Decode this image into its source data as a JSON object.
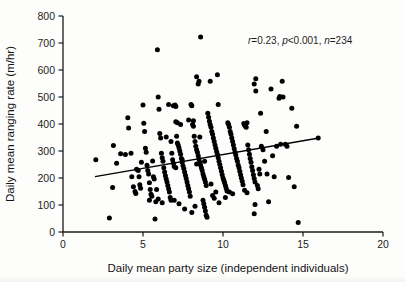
{
  "chart_data": {
    "type": "scatter",
    "title": "",
    "xlabel": "Daily mean party size (independent individuals)",
    "ylabel": "Daily mean ranging rate (m/hr)",
    "xlim": [
      0,
      20
    ],
    "ylim": [
      0,
      800
    ],
    "xticks": [
      0,
      5,
      10,
      15,
      20
    ],
    "yticks": [
      0,
      100,
      200,
      300,
      400,
      500,
      600,
      700,
      800
    ],
    "grid": false,
    "legend": null,
    "marker": {
      "shape": "circle",
      "color": "#000000",
      "size_px": 5
    },
    "annotations": [
      {
        "name": "stats-annotation",
        "text": "r=0.23, p<0.001, n=234",
        "parts": [
          {
            "text": "r",
            "italic": true
          },
          {
            "text": "=0.23, ",
            "italic": false
          },
          {
            "text": "p",
            "italic": true
          },
          {
            "text": "<0.001, ",
            "italic": false
          },
          {
            "text": "n",
            "italic": true
          },
          {
            "text": "=234",
            "italic": false
          }
        ],
        "x": 9.7,
        "y": 722
      }
    ],
    "statistics": {
      "r": 0.23,
      "p": "<0.001",
      "n": 234
    },
    "trendline": {
      "type": "linear",
      "x_start": 2.0,
      "y_start": 205,
      "x_end": 16.0,
      "y_end": 348,
      "color": "#000000",
      "width_px": 1.4
    },
    "points": [
      [
        2.05,
        268
      ],
      [
        2.9,
        52
      ],
      [
        3.15,
        320
      ],
      [
        3.1,
        165
      ],
      [
        3.35,
        255
      ],
      [
        3.6,
        290
      ],
      [
        3.9,
        287
      ],
      [
        4.05,
        423
      ],
      [
        4.1,
        385
      ],
      [
        4.25,
        292
      ],
      [
        4.3,
        205
      ],
      [
        4.4,
        168
      ],
      [
        4.5,
        150
      ],
      [
        4.55,
        143
      ],
      [
        4.6,
        232
      ],
      [
        4.7,
        228
      ],
      [
        4.75,
        205
      ],
      [
        4.8,
        175
      ],
      [
        4.85,
        162
      ],
      [
        4.9,
        258
      ],
      [
        5.0,
        470
      ],
      [
        5.05,
        403
      ],
      [
        5.1,
        372
      ],
      [
        5.15,
        310
      ],
      [
        5.2,
        295
      ],
      [
        5.25,
        247
      ],
      [
        5.3,
        228
      ],
      [
        5.35,
        215
      ],
      [
        5.4,
        182
      ],
      [
        5.45,
        157
      ],
      [
        5.5,
        140
      ],
      [
        5.55,
        132
      ],
      [
        5.6,
        263
      ],
      [
        5.65,
        205
      ],
      [
        5.7,
        196
      ],
      [
        5.75,
        48
      ],
      [
        5.8,
        112
      ],
      [
        5.85,
        157
      ],
      [
        5.9,
        675
      ],
      [
        5.95,
        500
      ],
      [
        6.0,
        455
      ],
      [
        6.05,
        365
      ],
      [
        6.1,
        348
      ],
      [
        6.15,
        292
      ],
      [
        6.2,
        275
      ],
      [
        6.25,
        262
      ],
      [
        6.3,
        238
      ],
      [
        6.35,
        222
      ],
      [
        6.4,
        208
      ],
      [
        6.45,
        196
      ],
      [
        6.5,
        185
      ],
      [
        6.55,
        172
      ],
      [
        6.6,
        160
      ],
      [
        6.65,
        148
      ],
      [
        6.7,
        128
      ],
      [
        6.75,
        118
      ],
      [
        6.8,
        292
      ],
      [
        6.85,
        268
      ],
      [
        6.9,
        255
      ],
      [
        6.95,
        243
      ],
      [
        7.0,
        470
      ],
      [
        7.05,
        465
      ],
      [
        7.1,
        355
      ],
      [
        7.15,
        330
      ],
      [
        7.2,
        322
      ],
      [
        7.25,
        312
      ],
      [
        7.3,
        300
      ],
      [
        7.35,
        288
      ],
      [
        7.4,
        272
      ],
      [
        7.45,
        258
      ],
      [
        7.5,
        245
      ],
      [
        7.55,
        235
      ],
      [
        7.6,
        222
      ],
      [
        7.65,
        210
      ],
      [
        7.7,
        198
      ],
      [
        7.75,
        185
      ],
      [
        7.8,
        172
      ],
      [
        7.85,
        160
      ],
      [
        7.9,
        148
      ],
      [
        7.95,
        132
      ],
      [
        8.0,
        472
      ],
      [
        8.05,
        468
      ],
      [
        8.1,
        398
      ],
      [
        8.15,
        392
      ],
      [
        8.2,
        355
      ],
      [
        8.25,
        335
      ],
      [
        8.3,
        318
      ],
      [
        8.35,
        305
      ],
      [
        8.4,
        295
      ],
      [
        8.45,
        282
      ],
      [
        8.5,
        270
      ],
      [
        8.55,
        258
      ],
      [
        8.6,
        248
      ],
      [
        8.65,
        238
      ],
      [
        8.7,
        228
      ],
      [
        8.75,
        215
      ],
      [
        8.8,
        205
      ],
      [
        8.85,
        195
      ],
      [
        8.9,
        185
      ],
      [
        8.95,
        172
      ],
      [
        8.6,
        722
      ],
      [
        8.35,
        575
      ],
      [
        8.45,
        548
      ],
      [
        8.5,
        558
      ],
      [
        8.75,
        118
      ],
      [
        8.8,
        105
      ],
      [
        8.85,
        92
      ],
      [
        8.9,
        78
      ],
      [
        8.95,
        62
      ],
      [
        9.0,
        55
      ],
      [
        9.05,
        440
      ],
      [
        9.1,
        425
      ],
      [
        9.15,
        410
      ],
      [
        9.2,
        398
      ],
      [
        9.25,
        388
      ],
      [
        9.3,
        372
      ],
      [
        9.35,
        362
      ],
      [
        9.4,
        348
      ],
      [
        9.45,
        335
      ],
      [
        9.5,
        322
      ],
      [
        9.55,
        310
      ],
      [
        9.6,
        298
      ],
      [
        9.65,
        288
      ],
      [
        9.7,
        275
      ],
      [
        9.75,
        262
      ],
      [
        9.8,
        250
      ],
      [
        9.85,
        238
      ],
      [
        9.9,
        225
      ],
      [
        9.95,
        212
      ],
      [
        10.0,
        200
      ],
      [
        9.2,
        558
      ],
      [
        9.65,
        582
      ],
      [
        9.7,
        472
      ],
      [
        9.75,
        108
      ],
      [
        9.55,
        148
      ],
      [
        10.05,
        192
      ],
      [
        10.1,
        182
      ],
      [
        10.15,
        172
      ],
      [
        10.2,
        162
      ],
      [
        10.25,
        152
      ],
      [
        10.3,
        405
      ],
      [
        10.35,
        398
      ],
      [
        10.4,
        388
      ],
      [
        10.45,
        372
      ],
      [
        10.5,
        362
      ],
      [
        10.55,
        348
      ],
      [
        10.6,
        335
      ],
      [
        10.65,
        322
      ],
      [
        10.7,
        308
      ],
      [
        10.75,
        295
      ],
      [
        10.8,
        285
      ],
      [
        10.85,
        272
      ],
      [
        10.9,
        262
      ],
      [
        10.95,
        248
      ],
      [
        11.0,
        238
      ],
      [
        11.05,
        225
      ],
      [
        11.1,
        212
      ],
      [
        11.15,
        200
      ],
      [
        11.2,
        188
      ],
      [
        11.25,
        175
      ],
      [
        11.3,
        402
      ],
      [
        11.35,
        396
      ],
      [
        11.4,
        392
      ],
      [
        11.45,
        388
      ],
      [
        11.5,
        405
      ],
      [
        11.55,
        322
      ],
      [
        11.6,
        305
      ],
      [
        11.65,
        288
      ],
      [
        11.7,
        272
      ],
      [
        11.75,
        258
      ],
      [
        11.8,
        242
      ],
      [
        11.85,
        228
      ],
      [
        11.9,
        212
      ],
      [
        11.95,
        198
      ],
      [
        12.0,
        185
      ],
      [
        11.95,
        548
      ],
      [
        12.05,
        522
      ],
      [
        12.05,
        568
      ],
      [
        12.0,
        102
      ],
      [
        11.95,
        68
      ],
      [
        12.15,
        172
      ],
      [
        12.2,
        160
      ],
      [
        12.25,
        232
      ],
      [
        12.3,
        215
      ],
      [
        12.35,
        440
      ],
      [
        12.4,
        318
      ],
      [
        12.5,
        305
      ],
      [
        12.6,
        262
      ],
      [
        12.7,
        372
      ],
      [
        12.75,
        215
      ],
      [
        12.85,
        112
      ],
      [
        13.0,
        530
      ],
      [
        13.1,
        282
      ],
      [
        13.2,
        205
      ],
      [
        13.35,
        318
      ],
      [
        13.5,
        495
      ],
      [
        13.55,
        502
      ],
      [
        13.6,
        325
      ],
      [
        13.7,
        558
      ],
      [
        13.75,
        500
      ],
      [
        13.9,
        325
      ],
      [
        14.0,
        318
      ],
      [
        14.1,
        202
      ],
      [
        14.3,
        458
      ],
      [
        14.45,
        168
      ],
      [
        14.6,
        392
      ],
      [
        14.7,
        35
      ],
      [
        15.95,
        348
      ],
      [
        6.6,
        472
      ],
      [
        6.9,
        468
      ],
      [
        7.05,
        408
      ],
      [
        7.15,
        405
      ],
      [
        7.35,
        398
      ],
      [
        6.45,
        352
      ],
      [
        6.75,
        335
      ],
      [
        7.85,
        415
      ],
      [
        8.15,
        412
      ],
      [
        8.55,
        352
      ],
      [
        8.25,
        95
      ],
      [
        8.05,
        72
      ],
      [
        7.6,
        85
      ],
      [
        7.25,
        105
      ],
      [
        6.95,
        118
      ],
      [
        6.2,
        108
      ],
      [
        5.95,
        122
      ],
      [
        5.4,
        118
      ],
      [
        10.4,
        148
      ],
      [
        10.6,
        142
      ],
      [
        11.35,
        155
      ],
      [
        11.5,
        145
      ],
      [
        9.35,
        135
      ],
      [
        9.45,
        125
      ],
      [
        10.15,
        128
      ],
      [
        7.05,
        238
      ],
      [
        7.45,
        268
      ],
      [
        8.35,
        252
      ],
      [
        8.85,
        262
      ],
      [
        9.25,
        178
      ]
    ]
  },
  "axes": {
    "x_tick_labels": [
      "0",
      "5",
      "10",
      "15",
      "20"
    ],
    "y_tick_labels": [
      "0",
      "100",
      "200",
      "300",
      "400",
      "500",
      "600",
      "700",
      "800"
    ]
  }
}
